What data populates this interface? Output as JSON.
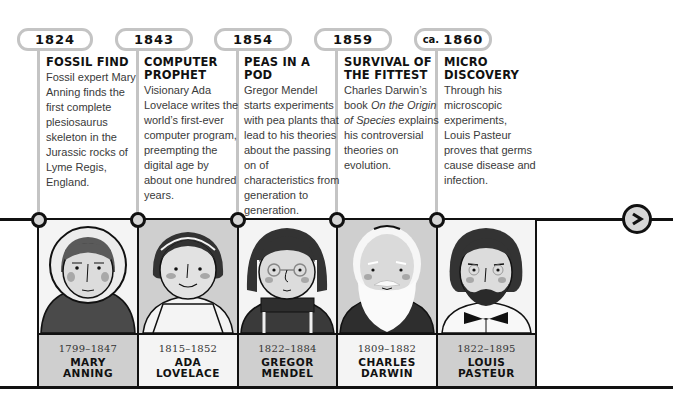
{
  "timeline": {
    "events": [
      {
        "year_prefix": "",
        "year": "1824",
        "title_line1": "Fossil Find",
        "title_line2": "",
        "desc": "Fossil expert Mary Anning finds the first complete plesiosaurus skeleton in the Jurassic rocks of Lyme Regis, England."
      },
      {
        "year_prefix": "",
        "year": "1843",
        "title_line1": "Computer",
        "title_line2": "Prophet",
        "desc": "Visionary Ada Lovelace writes the world’s first-ever computer program, preempting the digital age by about one hundred years."
      },
      {
        "year_prefix": "",
        "year": "1854",
        "title_line1": "Peas in a Pod",
        "title_line2": "",
        "desc": "Gregor Mendel starts experiments with pea plants that lead to his theories about the passing on of characteristics from generation to generation."
      },
      {
        "year_prefix": "",
        "year": "1859",
        "title_line1": "Survival of",
        "title_line2": "the Fittest",
        "desc_before_italic": "Charles Darwin’s book ",
        "desc_italic": "On the Origin of Species",
        "desc_after_italic": " explains his controversial theories on evolution."
      },
      {
        "year_prefix": "ca.",
        "year": "1860",
        "title_line1": "Micro",
        "title_line2": "Discovery",
        "desc": "Through his microscopic experiments, Louis Pasteur proves that germs cause disease and infection."
      }
    ],
    "people": [
      {
        "dates": "1799–1847",
        "name_line1": "Mary",
        "name_line2": "Anning"
      },
      {
        "dates": "1815–1852",
        "name_line1": "Ada",
        "name_line2": "Lovelace"
      },
      {
        "dates": "1822–1884",
        "name_line1": "Gregor",
        "name_line2": "Mendel"
      },
      {
        "dates": "1809–1882",
        "name_line1": "Charles",
        "name_line2": "Darwin"
      },
      {
        "dates": "1822–1895",
        "name_line1": "Louis",
        "name_line2": "Pasteur"
      }
    ],
    "next_button": {
      "icon": "chevron-right-icon"
    }
  },
  "colors": {
    "line": "#111111",
    "connector_gray": "#c4c4c4",
    "label_gray": "#cfcfcf",
    "label_white": "#f4f4f4",
    "node_fill": "#d6d6d6"
  }
}
